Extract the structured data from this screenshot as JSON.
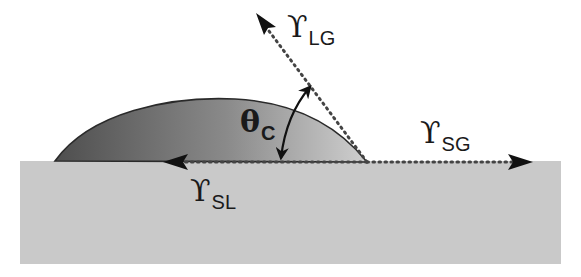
{
  "diagram": {
    "labels": {
      "gamma_lg": {
        "symbol": "ϒ",
        "subscript": "LG"
      },
      "gamma_sg": {
        "symbol": "ϒ",
        "subscript": "SG"
      },
      "gamma_sl": {
        "symbol": "ϒ",
        "subscript": "SL"
      },
      "theta_c": {
        "symbol": "θ",
        "subscript": "C"
      }
    },
    "colors": {
      "background": "#ffffff",
      "substrate": "#c9c9c9",
      "drop_dark": "#5a5a5a",
      "drop_light": "#c2c2c2",
      "outline": "#2a2a2a",
      "dots": "#444444",
      "arrow": "#111111"
    },
    "elements": {
      "substrate": "solid surface",
      "drop": "liquid droplet",
      "vectors": [
        "interfacial tension liquid-gas",
        "interfacial tension solid-gas",
        "interfacial tension solid-liquid"
      ],
      "angle": "contact angle"
    }
  }
}
